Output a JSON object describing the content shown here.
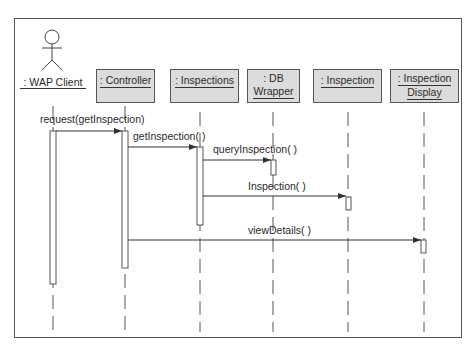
{
  "diagram": {
    "type": "UML sequence diagram",
    "actor": {
      "label": ": WAP Client"
    },
    "objects": [
      {
        "id": "controller",
        "lines": [
          ": Controller"
        ]
      },
      {
        "id": "inspections",
        "lines": [
          ": Inspections"
        ]
      },
      {
        "id": "dbwrapper",
        "lines": [
          ": DB",
          "Wrapper"
        ]
      },
      {
        "id": "inspection",
        "lines": [
          ": Inspection"
        ]
      },
      {
        "id": "inspectiondisplay",
        "lines": [
          ": Inspection",
          "Display"
        ]
      }
    ],
    "messages": [
      {
        "from": "wapclient",
        "to": "controller",
        "label": "request(getInspection)"
      },
      {
        "from": "controller",
        "to": "inspections",
        "label": "getInspection( )"
      },
      {
        "from": "inspections",
        "to": "dbwrapper",
        "label": "queryInspection( )"
      },
      {
        "from": "inspections",
        "to": "inspection",
        "label": "Inspection( )"
      },
      {
        "from": "controller",
        "to": "inspectiondisplay",
        "label": "viewDetails( )"
      }
    ],
    "colors": {
      "object_fill": "#dcdcdc",
      "line": "#555555"
    }
  }
}
